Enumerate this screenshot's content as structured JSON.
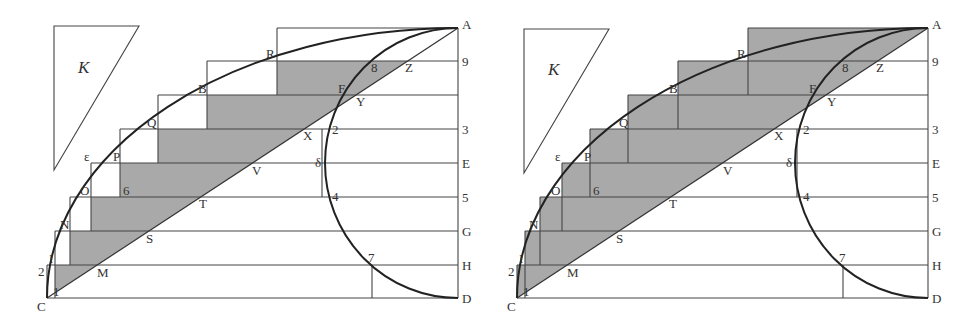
{
  "colors": {
    "shade": "#a9a9a9",
    "line": "#444444",
    "background": "#ffffff"
  },
  "figures": [
    {
      "id": "left",
      "description": "Inscribed and circumscribed staircase; shaded region between staircase and diagonal CA",
      "labels": {
        "K": "K",
        "A": "A",
        "nine": "9",
        "three": "3",
        "E": "E",
        "five": "5",
        "G": "G",
        "H": "H",
        "D": "D",
        "R": "R",
        "eight": "8",
        "Z": "Z",
        "F": "F",
        "Y": "Y",
        "B": "B",
        "Q": "Q",
        "X": "X",
        "two_top": "2",
        "epsilon": "ε",
        "P": "P",
        "V": "V",
        "delta": "δ",
        "O": "O",
        "six": "6",
        "T": "T",
        "four": "4",
        "N": "N",
        "S": "S",
        "I": "I",
        "two_left": "2",
        "M": "M",
        "seven": "7",
        "C": "C",
        "one": "1"
      }
    },
    {
      "id": "right",
      "description": "Same construction; shaded region covers full circumscribed staircase above diagonal CA",
      "labels": {
        "K": "K",
        "A": "A",
        "nine": "9",
        "three": "3",
        "E": "E",
        "five": "5",
        "G": "G",
        "H": "H",
        "D": "D",
        "R": "R",
        "eight": "8",
        "Z": "Z",
        "F": "F",
        "Y": "Y",
        "B": "B",
        "Q": "Q",
        "X": "X",
        "two_top": "2",
        "epsilon": "ε",
        "P": "P",
        "V": "V",
        "delta": "δ",
        "O": "O",
        "six": "6",
        "T": "T",
        "four": "4",
        "N": "N",
        "S": "S",
        "I": "I",
        "two_left": "2",
        "M": "M",
        "seven": "7",
        "C": "C",
        "one": "1"
      }
    }
  ]
}
